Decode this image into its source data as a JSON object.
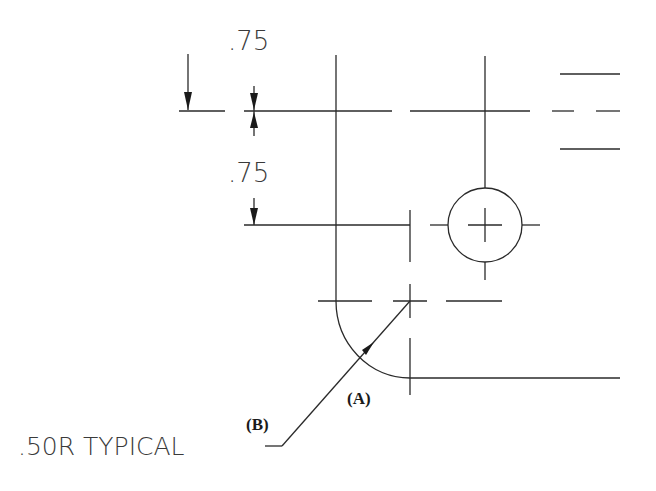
{
  "drawing": {
    "dimensions": [
      {
        "id": "top_offset",
        "value": ".75"
      },
      {
        "id": "second_offset",
        "value": ".75"
      }
    ],
    "note": ".50R TYPICAL",
    "callouts": {
      "a": "(A)",
      "b": "(B)"
    },
    "colors": {
      "line": "#2a2a2a",
      "background": "#ffffff"
    }
  }
}
